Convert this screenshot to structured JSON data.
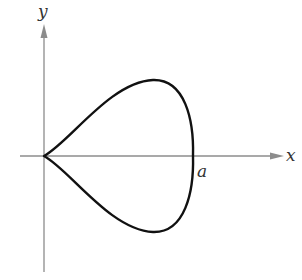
{
  "figure": {
    "type": "graph-of-closed-curve",
    "axes": {
      "x_label": "x",
      "y_label": "y",
      "axis_color": "#8c8c8c"
    },
    "curve": {
      "color": "#111111",
      "description": "teardrop-shaped closed loop with cusp at origin, symmetric about x-axis, crossing x-axis at a"
    },
    "annotations": {
      "intercept_label": "a"
    }
  }
}
